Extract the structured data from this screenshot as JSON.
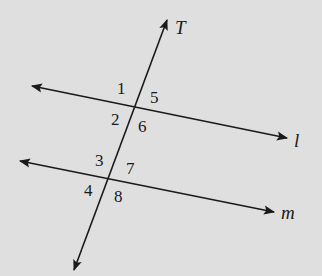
{
  "diagram": {
    "type": "parallel-lines-cut-by-transversal",
    "background_color": "#dfdfdf",
    "stroke_color": "#1a1a1a",
    "transversal": {
      "label": "T"
    },
    "line_l": {
      "label": "l"
    },
    "line_m": {
      "label": "m"
    },
    "angles": {
      "a1": "1",
      "a2": "2",
      "a5": "5",
      "a6": "6",
      "a3": "3",
      "a4": "4",
      "a7": "7",
      "a8": "8"
    }
  }
}
